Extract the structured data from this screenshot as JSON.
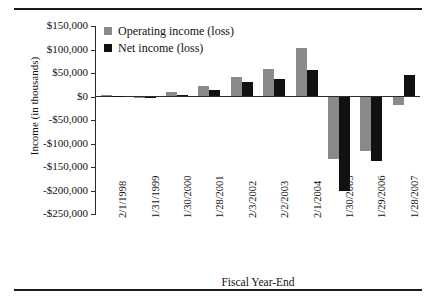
{
  "chart_data": {
    "type": "bar",
    "title": "",
    "xlabel": "Fiscal Year-End",
    "ylabel": "Income (in thousands)",
    "categories": [
      "2/1/1998",
      "1/31/1999",
      "1/30/2000",
      "1/28/2001",
      "2/3/2002",
      "2/2/2003",
      "2/1/2004",
      "1/30/2005",
      "1/29/2006",
      "1/28/2007"
    ],
    "series": [
      {
        "name": "Operating income (loss)",
        "color": "#8a8a8a",
        "values": [
          3000,
          -3000,
          9000,
          22000,
          42000,
          58000,
          104000,
          -133000,
          -115000,
          -18000
        ]
      },
      {
        "name": "Net income (loss)",
        "color": "#111111",
        "values": [
          2000,
          -3000,
          4000,
          14000,
          30000,
          37000,
          57000,
          -200000,
          -137000,
          45000
        ]
      }
    ],
    "ylim": [
      -250000,
      150000
    ],
    "ytick_values": [
      150000,
      100000,
      50000,
      0,
      -50000,
      -100000,
      -150000,
      -200000,
      -250000
    ],
    "ytick_labels": [
      "$150,000",
      "$100,000",
      "$50,000",
      "$0",
      "-$50,000",
      "-$100,000",
      "-$150,000",
      "-$200,000",
      "-$250,000"
    ],
    "grid": false,
    "legend_position": "top-left"
  },
  "figure": {
    "top_rule": "",
    "bottom_rule": ""
  }
}
